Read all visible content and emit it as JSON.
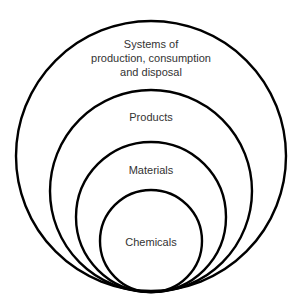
{
  "diagram": {
    "type": "nested-circles",
    "colors": {
      "stroke": "#000000",
      "text": "#333333",
      "background": "#ffffff"
    },
    "circles": [
      {
        "label_lines": [
          "Systems of",
          "production, consumption",
          "and disposal"
        ],
        "cx": 151,
        "cy": 156,
        "r": 135
      },
      {
        "label_lines": [
          "Products"
        ],
        "cx": 151,
        "cy": 191,
        "r": 101
      },
      {
        "label_lines": [
          "Materials"
        ],
        "cx": 151,
        "cy": 217,
        "r": 75
      },
      {
        "label_lines": [
          "Chemicals"
        ],
        "cx": 151,
        "cy": 241,
        "r": 51
      }
    ]
  }
}
